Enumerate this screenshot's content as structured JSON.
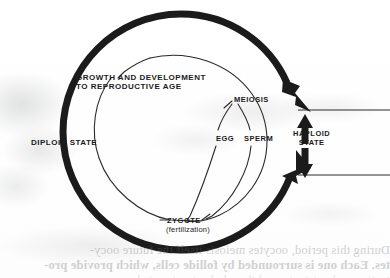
{
  "figure": {
    "labels": {
      "growth_line1": "GROWTH AND DEVELOPMENT",
      "growth_line2": "TO REPRODUCTIVE AGE",
      "diploid_state": "DIPLOID STATE",
      "meiosis": "MEIOSIS",
      "egg": "EGG",
      "sperm": "SPERM",
      "haploid_line1": "HAPLOID",
      "haploid_line2": "STATE",
      "zygote": "ZYGOTE",
      "fertilization": "(fertilization)"
    },
    "colors": {
      "ink": "#1b1b1b",
      "thin_line": "#2a2a2a",
      "paper": "#ffffff",
      "smudge": "#a9abad",
      "bleed_text": "#6a6a6a"
    },
    "geometry": {
      "outer_circle_center_x": 181,
      "outer_circle_center_y": 132,
      "outer_circle_radius": 118,
      "outer_circle_stroke_width": 7,
      "inner_circle_center_x": 186,
      "inner_circle_center_y": 135,
      "inner_circle_radius": 82,
      "inner_circle_stroke_width": 1,
      "haploid_band_top_y": 110,
      "haploid_band_bottom_y": 175,
      "band_line_right_x": 390
    }
  },
  "bleed_through": {
    "line1": "During this period, oocytes meiosis itself the future oocy-",
    "line2": "tes. Each one is surrounded by follide cells, which provide pro-",
    "line3": "tection and nutrients, and the whole structure is known as a"
  }
}
